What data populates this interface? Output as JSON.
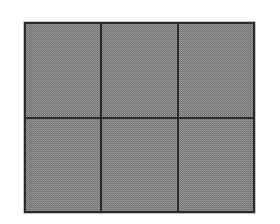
{
  "figure": {
    "caption": "",
    "type": "grid-of-panels",
    "background_color": "#ffffff",
    "frame": {
      "x": 24,
      "y": 22,
      "width": 231,
      "height": 191,
      "border_color": "#2b2b2b",
      "border_width": 2
    },
    "grid": {
      "rows": 2,
      "columns": 3,
      "divider_color": "#2b2b2b",
      "divider_width": 2,
      "cell_fill_color": "#9a9a9a",
      "cell_texture": "dithered-checkerboard",
      "cell_texture_dark_color": "#6f6f6f"
    },
    "cells": [
      {
        "id": "cell-r1c1",
        "label": "",
        "row": 1,
        "column": 1,
        "fill": "#9a9a9a"
      },
      {
        "id": "cell-r1c2",
        "label": "",
        "row": 1,
        "column": 2,
        "fill": "#9a9a9a"
      },
      {
        "id": "cell-r1c3",
        "label": "",
        "row": 1,
        "column": 3,
        "fill": "#9a9a9a"
      },
      {
        "id": "cell-r2c1",
        "label": "",
        "row": 2,
        "column": 1,
        "fill": "#9a9a9a"
      },
      {
        "id": "cell-r2c2",
        "label": "",
        "row": 2,
        "column": 2,
        "fill": "#9a9a9a"
      },
      {
        "id": "cell-r2c3",
        "label": "",
        "row": 2,
        "column": 3,
        "fill": "#9a9a9a"
      }
    ]
  }
}
